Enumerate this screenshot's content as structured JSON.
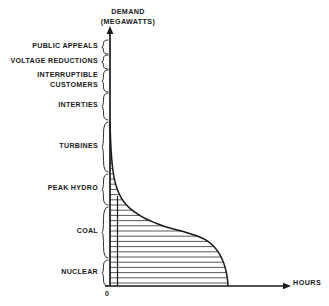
{
  "figure": {
    "kind": "load-duration-curve",
    "background_color": "#ffffff",
    "line_color": "#1a1a1a",
    "hatch_color": "#3a3a3a"
  },
  "axes": {
    "y_title": "DEMAND\n(MEGAWATTS)",
    "y_title_line1": "DEMAND",
    "y_title_line2": "(MEGAWATTS)",
    "x_title": "HOURS",
    "origin_label": "0"
  },
  "bands": [
    {
      "label": "PUBLIC APPEALS",
      "y_top": 40,
      "y_bottom": 54
    },
    {
      "label": "VOLTAGE REDUCTIONS",
      "y_top": 55,
      "y_bottom": 69
    },
    {
      "label": "INTERRUPTIBLE\nCUSTOMERS",
      "y_top": 70,
      "y_bottom": 92
    },
    {
      "label": "INTERTIES",
      "y_top": 93,
      "y_bottom": 120
    },
    {
      "label": "TURBINES",
      "y_top": 122,
      "y_bottom": 172
    },
    {
      "label": "PEAK HYDRO",
      "y_top": 174,
      "y_bottom": 205
    },
    {
      "label": "COAL",
      "y_top": 207,
      "y_bottom": 258
    },
    {
      "label": "NUCLEAR",
      "y_top": 260,
      "y_bottom": 286
    }
  ],
  "chart_data": {
    "type": "area",
    "xlabel": "HOURS",
    "ylabel": "DEMAND (MEGAWATTS)",
    "grid": false,
    "legend": "none",
    "axis_style": "arrow-tipped open axes",
    "xlim": [
      0,
      100
    ],
    "ylim": [
      0,
      100
    ],
    "x_ticks": [
      "0"
    ],
    "y_ticks": [],
    "curve_name": "load duration curve",
    "curve_points_percent": [
      {
        "x": 0.0,
        "y": 100.0
      },
      {
        "x": 0.5,
        "y": 88.0
      },
      {
        "x": 1.2,
        "y": 78.0
      },
      {
        "x": 2.2,
        "y": 70.0
      },
      {
        "x": 3.5,
        "y": 64.0
      },
      {
        "x": 5.5,
        "y": 58.5
      },
      {
        "x": 8.0,
        "y": 54.0
      },
      {
        "x": 11.0,
        "y": 50.5
      },
      {
        "x": 15.0,
        "y": 47.0
      },
      {
        "x": 20.0,
        "y": 44.0
      },
      {
        "x": 26.0,
        "y": 41.0
      },
      {
        "x": 33.0,
        "y": 38.5
      },
      {
        "x": 41.0,
        "y": 36.0
      },
      {
        "x": 50.0,
        "y": 34.0
      },
      {
        "x": 58.0,
        "y": 32.0
      },
      {
        "x": 65.0,
        "y": 30.0
      },
      {
        "x": 71.0,
        "y": 27.5
      },
      {
        "x": 76.0,
        "y": 24.0
      },
      {
        "x": 80.0,
        "y": 19.5
      },
      {
        "x": 83.0,
        "y": 14.0
      },
      {
        "x": 85.0,
        "y": 8.0
      },
      {
        "x": 86.0,
        "y": 2.0
      },
      {
        "x": 86.0,
        "y": 0.0
      }
    ],
    "tiers": [
      {
        "name": "PUBLIC APPEALS",
        "order": 8,
        "share_percent": 5
      },
      {
        "name": "VOLTAGE REDUCTIONS",
        "order": 7,
        "share_percent": 5
      },
      {
        "name": "INTERRUPTIBLE CUSTOMERS",
        "order": 6,
        "share_percent": 9
      },
      {
        "name": "INTERTIES",
        "order": 5,
        "share_percent": 11
      },
      {
        "name": "TURBINES",
        "order": 4,
        "share_percent": 20
      },
      {
        "name": "PEAK HYDRO",
        "order": 3,
        "share_percent": 13
      },
      {
        "name": "COAL",
        "order": 2,
        "share_percent": 21
      },
      {
        "name": "NUCLEAR",
        "order": 1,
        "share_percent": 11
      }
    ]
  }
}
